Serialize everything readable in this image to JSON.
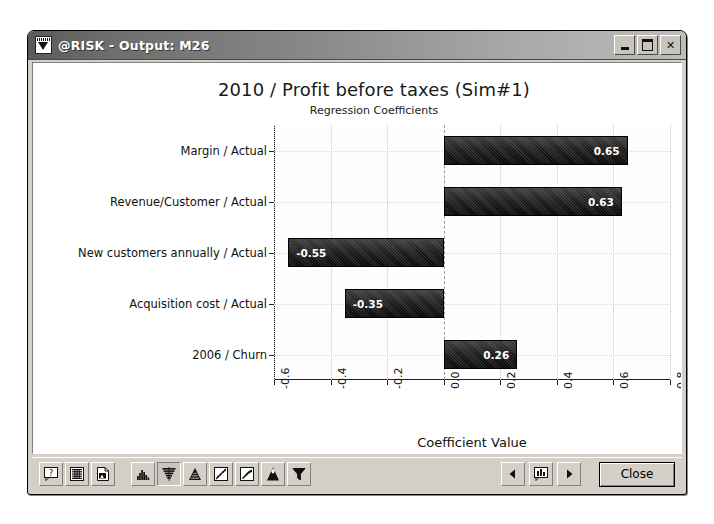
{
  "window": {
    "title": "@RISK - Output: M26",
    "icon": "atrisk-tornado-icon",
    "buttons": {
      "minimize": "–",
      "maximize": "□",
      "close": "✕"
    }
  },
  "chart_data": {
    "type": "bar",
    "orientation": "horizontal",
    "title": "2010 / Profit before taxes (Sim#1)",
    "subtitle": "Regression Coefficients",
    "xlabel": "Coefficient Value",
    "ylabel": "",
    "xlim": [
      -0.6,
      0.8
    ],
    "xticks": [
      "-0.6",
      "-0.4",
      "-0.2",
      "0.0",
      "0.2",
      "0.4",
      "0.6",
      "0.8"
    ],
    "xtick_values": [
      -0.6,
      -0.4,
      -0.2,
      0.0,
      0.2,
      0.4,
      0.6,
      0.8
    ],
    "grid": true,
    "legend": false,
    "categories": [
      "Margin / Actual",
      "Revenue/Customer / Actual",
      "New customers annually / Actual",
      "Acquisition cost / Actual",
      "2006 / Churn"
    ],
    "values": [
      0.65,
      0.63,
      -0.55,
      -0.35,
      0.26
    ],
    "labels": [
      "0.65",
      "0.63",
      "-0.55",
      "-0.35",
      "0.26"
    ],
    "bar_color": "#111111"
  },
  "toolbar": {
    "left_buttons": [
      {
        "name": "help-icon",
        "tip": "Help"
      },
      {
        "name": "data-grid-icon",
        "tip": "Simulation Data"
      },
      {
        "name": "report-icon",
        "tip": "Report"
      }
    ],
    "chart_buttons": [
      {
        "name": "histogram-icon",
        "tip": "Histogram"
      },
      {
        "name": "tornado-icon",
        "tip": "Tornado",
        "active": true
      },
      {
        "name": "cumulative-icon",
        "tip": "Cumulative"
      },
      {
        "name": "scatter-icon",
        "tip": "Scatter Plot"
      },
      {
        "name": "trend-icon",
        "tip": "Summary Trend"
      },
      {
        "name": "pyramid-icon",
        "tip": "Sensitivity"
      },
      {
        "name": "filter-icon",
        "tip": "Filter"
      }
    ],
    "nav": {
      "prev": "◀",
      "next": "▶",
      "chart_icon": "bar-chart-icon"
    },
    "close_label": "Close"
  }
}
